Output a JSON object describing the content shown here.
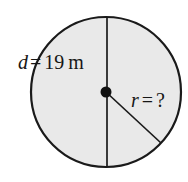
{
  "figure": {
    "kind": "circle-diagram",
    "background_color": "#ffffff",
    "circle": {
      "fill_color": "#e9e9e9",
      "stroke_color": "#1a1a1a",
      "center_x": 106,
      "center_y": 92,
      "radius": 75
    },
    "center_dot": {
      "color": "#111111",
      "radius": 5.5
    },
    "diameter_line": {
      "color": "#1a1a1a",
      "orientation": "vertical",
      "x": 107,
      "y_top": 17,
      "y_bottom": 167
    },
    "radius_line": {
      "color": "#1a1a1a",
      "from_x": 106,
      "from_y": 92,
      "to_x": 161,
      "to_y": 143
    },
    "labels": {
      "diameter": {
        "variable": "d",
        "operator": "=",
        "value": "19",
        "unit": "m",
        "full_text": "d = 19 m"
      },
      "radius": {
        "variable": "r",
        "operator": "=",
        "value": "?",
        "unit": "",
        "full_text": "r = ?"
      }
    }
  }
}
